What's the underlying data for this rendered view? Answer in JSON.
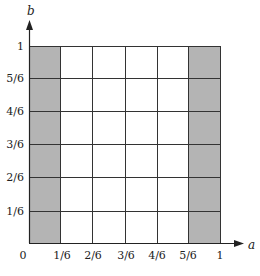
{
  "diagram": {
    "type": "unit-square-grid",
    "x_axis": {
      "name": "a",
      "tick_labels": [
        "0",
        "1/6",
        "2/6",
        "3/6",
        "4/6",
        "5/6",
        "1"
      ]
    },
    "y_axis": {
      "name": "b",
      "tick_labels": [
        "1/6",
        "2/6",
        "3/6",
        "4/6",
        "5/6",
        "1"
      ]
    },
    "origin_label": "0",
    "grid_divisions": 6,
    "shaded_regions": [
      {
        "a_from": "0",
        "a_to": "1/6",
        "b_from": "0",
        "b_to": "1"
      },
      {
        "a_from": "5/6",
        "a_to": "1",
        "b_from": "0",
        "b_to": "1"
      }
    ],
    "colors": {
      "shade": "#b4b4b4",
      "line": "#333333",
      "background": "#ffffff"
    }
  }
}
